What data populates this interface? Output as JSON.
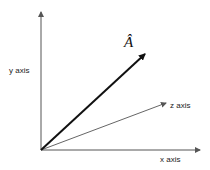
{
  "diagram": {
    "type": "3d-coordinate-axes-with-vector",
    "labels": {
      "y_axis": "y axis",
      "x_axis": "x axis",
      "z_axis": "z axis",
      "vector": "Â"
    },
    "colors": {
      "axis": "#555555",
      "vector": "#111111",
      "background": "#ffffff"
    }
  }
}
